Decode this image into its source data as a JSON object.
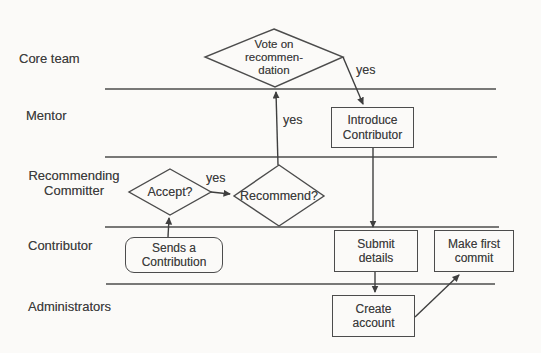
{
  "diagram": {
    "lanes": [
      {
        "label": "Core team"
      },
      {
        "label": "Mentor"
      },
      {
        "label": "Recommending Committer"
      },
      {
        "label": "Contributor"
      },
      {
        "label": "Administrators"
      }
    ],
    "nodes": {
      "vote": "Vote on\nrecommen-\ndation",
      "introduce": "Introduce\nContributor",
      "accept": "Accept?",
      "recommend": "Recommend?",
      "sends": "Sends a\nContribution",
      "submit": "Submit\ndetails",
      "make_first": "Make first\ncommit",
      "create": "Create\naccount"
    },
    "edge_labels": {
      "vote_to_introduce": "yes",
      "recommend_to_vote": "yes",
      "accept_to_recommend": "yes"
    },
    "colors": {
      "line": "#4c4c4c",
      "text": "#3d3d3d",
      "background": "#fbfaf8"
    }
  }
}
